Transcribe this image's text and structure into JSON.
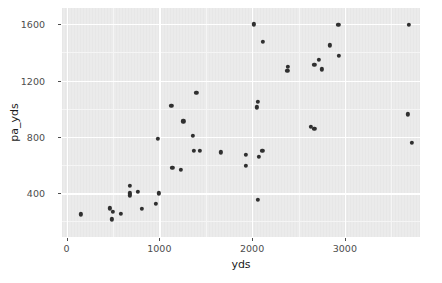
{
  "chart_data": {
    "type": "scatter",
    "title": "",
    "xlabel": "yds",
    "ylabel": "pa_yds",
    "xlim": [
      -50,
      3810
    ],
    "ylim": [
      90,
      1715
    ],
    "xticks": [
      0,
      1000,
      2000,
      3000
    ],
    "xtick_labels": [
      "0",
      "1000",
      "2000",
      "3000"
    ],
    "yticks": [
      400,
      800,
      1200,
      1600
    ],
    "ytick_labels": [
      "400",
      "800",
      "1200",
      "1600"
    ],
    "grid": true,
    "grid_major_color": "#ffffff",
    "grid_minor_color": "#f5f5f5",
    "panel_color": "#ebebeb",
    "point_color": "#303030",
    "legend": null,
    "series": [
      {
        "name": "teams",
        "points": [
          {
            "yds": 152,
            "pa_yds": 250
          },
          {
            "yds": 467,
            "pa_yds": 293
          },
          {
            "yds": 500,
            "pa_yds": 270
          },
          {
            "yds": 490,
            "pa_yds": 215
          },
          {
            "yds": 586,
            "pa_yds": 252
          },
          {
            "yds": 680,
            "pa_yds": 455
          },
          {
            "yds": 680,
            "pa_yds": 400
          },
          {
            "yds": 680,
            "pa_yds": 385
          },
          {
            "yds": 765,
            "pa_yds": 410
          },
          {
            "yds": 810,
            "pa_yds": 290
          },
          {
            "yds": 960,
            "pa_yds": 325
          },
          {
            "yds": 993,
            "pa_yds": 400
          },
          {
            "yds": 1140,
            "pa_yds": 580
          },
          {
            "yds": 1230,
            "pa_yds": 565
          },
          {
            "yds": 1130,
            "pa_yds": 1020
          },
          {
            "yds": 1400,
            "pa_yds": 1115
          },
          {
            "yds": 1260,
            "pa_yds": 910
          },
          {
            "yds": 1360,
            "pa_yds": 810
          },
          {
            "yds": 985,
            "pa_yds": 785
          },
          {
            "yds": 1370,
            "pa_yds": 700
          },
          {
            "yds": 1435,
            "pa_yds": 700
          },
          {
            "yds": 1660,
            "pa_yds": 690
          },
          {
            "yds": 1930,
            "pa_yds": 675
          },
          {
            "yds": 1935,
            "pa_yds": 595
          },
          {
            "yds": 2060,
            "pa_yds": 355
          },
          {
            "yds": 2020,
            "pa_yds": 1600
          },
          {
            "yds": 2115,
            "pa_yds": 1475
          },
          {
            "yds": 2060,
            "pa_yds": 1050
          },
          {
            "yds": 2050,
            "pa_yds": 1010
          },
          {
            "yds": 2110,
            "pa_yds": 700
          },
          {
            "yds": 2070,
            "pa_yds": 660
          },
          {
            "yds": 2385,
            "pa_yds": 1295
          },
          {
            "yds": 2380,
            "pa_yds": 1270
          },
          {
            "yds": 2670,
            "pa_yds": 1310
          },
          {
            "yds": 2720,
            "pa_yds": 1345
          },
          {
            "yds": 2755,
            "pa_yds": 1280
          },
          {
            "yds": 2930,
            "pa_yds": 1595
          },
          {
            "yds": 2935,
            "pa_yds": 1375
          },
          {
            "yds": 2840,
            "pa_yds": 1450
          },
          {
            "yds": 2635,
            "pa_yds": 870
          },
          {
            "yds": 2670,
            "pa_yds": 855
          },
          {
            "yds": 3690,
            "pa_yds": 1595
          },
          {
            "yds": 3680,
            "pa_yds": 960
          },
          {
            "yds": 3720,
            "pa_yds": 760
          }
        ]
      }
    ]
  }
}
